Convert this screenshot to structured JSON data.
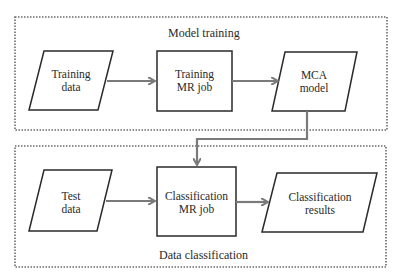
{
  "sections": {
    "training": {
      "label": "Model training"
    },
    "classification": {
      "label": "Data classification"
    }
  },
  "nodes": {
    "training_data": {
      "line1": "Training",
      "line2": "data",
      "shape": "parallelogram"
    },
    "training_job": {
      "line1": "Training",
      "line2": "MR job",
      "shape": "rectangle"
    },
    "mca_model": {
      "line1": "MCA",
      "line2": "model",
      "shape": "parallelogram"
    },
    "test_data": {
      "line1": "Test",
      "line2": "data",
      "shape": "parallelogram"
    },
    "classification_job": {
      "line1": "Classification",
      "line2": "MR job",
      "shape": "rectangle"
    },
    "classification_results": {
      "line1": "Classification",
      "line2": "results",
      "shape": "parallelogram"
    }
  },
  "edges": [
    {
      "from": "training_data",
      "to": "training_job"
    },
    {
      "from": "training_job",
      "to": "mca_model"
    },
    {
      "from": "mca_model",
      "to": "classification_job"
    },
    {
      "from": "test_data",
      "to": "classification_job"
    },
    {
      "from": "classification_job",
      "to": "classification_results"
    }
  ],
  "colors": {
    "stroke": "#2a2a2a",
    "arrow": "#7a7a7a",
    "dotted": "#6a6a6a"
  }
}
